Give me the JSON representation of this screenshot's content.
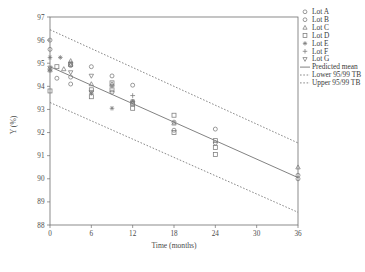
{
  "chart_data": {
    "type": "scatter",
    "title": "",
    "xlabel": "Time (months)",
    "ylabel": "Y (%)",
    "xlim": [
      0,
      36
    ],
    "ylim": [
      88,
      97
    ],
    "xticks": [
      0,
      6,
      12,
      18,
      24,
      30,
      36
    ],
    "yticks": [
      88,
      89,
      90,
      91,
      92,
      93,
      94,
      95,
      96,
      97
    ],
    "grid": false,
    "legend_position": "outside-top-right",
    "series": [
      {
        "name": "Lot A",
        "marker": "circle",
        "points": [
          {
            "x": 0,
            "y": 96.0
          },
          {
            "x": 0,
            "y": 95.6
          },
          {
            "x": 3,
            "y": 95.0
          },
          {
            "x": 6,
            "y": 94.85
          },
          {
            "x": 9,
            "y": 94.45
          },
          {
            "x": 12,
            "y": 94.05
          },
          {
            "x": 18,
            "y": 92.45
          },
          {
            "x": 24,
            "y": 92.15
          },
          {
            "x": 36,
            "y": 90.15
          }
        ]
      },
      {
        "name": "Lot B",
        "marker": "circle",
        "points": [
          {
            "x": 0,
            "y": 94.75
          },
          {
            "x": 1,
            "y": 94.35
          },
          {
            "x": 3,
            "y": 94.9
          },
          {
            "x": 3,
            "y": 94.4
          },
          {
            "x": 3,
            "y": 94.1
          },
          {
            "x": 9,
            "y": 93.75
          },
          {
            "x": 12,
            "y": 93.35
          },
          {
            "x": 18,
            "y": 92.1
          },
          {
            "x": 24,
            "y": 91.55
          },
          {
            "x": 36,
            "y": 90.0
          }
        ]
      },
      {
        "name": "Lot C",
        "marker": "triangle-up",
        "points": [
          {
            "x": 0,
            "y": 94.7
          },
          {
            "x": 2,
            "y": 94.75
          },
          {
            "x": 3,
            "y": 95.1
          },
          {
            "x": 3,
            "y": 94.95
          },
          {
            "x": 6,
            "y": 94.1
          },
          {
            "x": 9,
            "y": 94.1
          },
          {
            "x": 12,
            "y": 93.3
          },
          {
            "x": 18,
            "y": 92.4
          },
          {
            "x": 36,
            "y": 90.5
          }
        ]
      },
      {
        "name": "Lot D",
        "marker": "square",
        "points": [
          {
            "x": 0,
            "y": 93.8
          },
          {
            "x": 1,
            "y": 94.85
          },
          {
            "x": 3,
            "y": 94.95
          },
          {
            "x": 6,
            "y": 93.85
          },
          {
            "x": 6,
            "y": 93.55
          },
          {
            "x": 9,
            "y": 94.15
          },
          {
            "x": 9,
            "y": 93.85
          },
          {
            "x": 12,
            "y": 93.25
          },
          {
            "x": 12,
            "y": 93.05
          },
          {
            "x": 18,
            "y": 92.75
          },
          {
            "x": 18,
            "y": 92.0
          },
          {
            "x": 24,
            "y": 91.65
          },
          {
            "x": 24,
            "y": 91.35
          },
          {
            "x": 24,
            "y": 91.05
          }
        ]
      },
      {
        "name": "Lot E",
        "marker": "asterisk",
        "points": [
          {
            "x": 0,
            "y": 95.25
          },
          {
            "x": 1.5,
            "y": 95.25
          },
          {
            "x": 6,
            "y": 93.7
          },
          {
            "x": 9,
            "y": 93.05
          },
          {
            "x": 12,
            "y": 93.35
          }
        ]
      },
      {
        "name": "Lot F",
        "marker": "plus",
        "points": [
          {
            "x": 0,
            "y": 94.7
          },
          {
            "x": 9,
            "y": 94.0
          },
          {
            "x": 12,
            "y": 93.6
          }
        ]
      },
      {
        "name": "Lot G",
        "marker": "triangle-down",
        "points": [
          {
            "x": 0,
            "y": 94.8
          },
          {
            "x": 3,
            "y": 94.6
          },
          {
            "x": 6,
            "y": 94.45
          },
          {
            "x": 6,
            "y": 93.75
          }
        ]
      }
    ],
    "lines": [
      {
        "name": "Predicted mean",
        "style": "solid",
        "x": [
          0,
          36
        ],
        "y": [
          94.85,
          90.05
        ]
      },
      {
        "name": "Lower 95/99 TB",
        "style": "dashed",
        "x": [
          0,
          36
        ],
        "y": [
          93.3,
          88.55
        ]
      },
      {
        "name": "Upper 95/99 TB",
        "style": "dashed",
        "x": [
          0,
          36
        ],
        "y": [
          96.45,
          91.55
        ]
      }
    ]
  },
  "legend": {
    "entries": [
      {
        "label": "Lot A",
        "marker": "circle"
      },
      {
        "label": "Lot B",
        "marker": "circle"
      },
      {
        "label": "Lot C",
        "marker": "triangle-up"
      },
      {
        "label": "Lot D",
        "marker": "square"
      },
      {
        "label": "Lot E",
        "marker": "asterisk"
      },
      {
        "label": "Lot F",
        "marker": "plus"
      },
      {
        "label": "Lot G",
        "marker": "triangle-down"
      },
      {
        "label": "Predicted mean",
        "marker": "solid-line"
      },
      {
        "label": "Lower 95/99 TB",
        "marker": "dashed-line"
      },
      {
        "label": "Upper 95/99 TB",
        "marker": "dashed-line"
      }
    ]
  },
  "colors": {
    "axis": "#6e6e6e",
    "marker": "#7a7a7a",
    "line": "#6b6b6b",
    "text": "#3a3a3a",
    "background": "#ffffff"
  }
}
